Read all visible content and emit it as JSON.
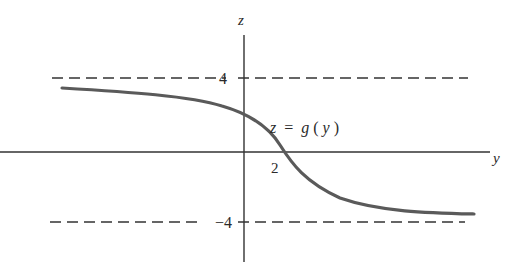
{
  "figure": {
    "type": "function-graph",
    "axes": {
      "vertical_label": "z",
      "horizontal_label": "y"
    },
    "tick_labels": {
      "upper_asymptote": "4",
      "lower_asymptote": "−4",
      "x_intercept": "2"
    },
    "curve_label": {
      "lhs": "z",
      "eq": "=",
      "func": "g",
      "arg_open": "(",
      "arg": "y",
      "arg_close": ")"
    },
    "asymptotes": [
      {
        "name": "upper",
        "value": 4,
        "style": "dashed"
      },
      {
        "name": "lower",
        "value": -4,
        "style": "dashed"
      }
    ],
    "colors": {
      "curve": "#5a5a5a",
      "axes": "#333333",
      "dashes": "#333333",
      "text": "#2a2a2a",
      "background": "#ffffff"
    }
  }
}
